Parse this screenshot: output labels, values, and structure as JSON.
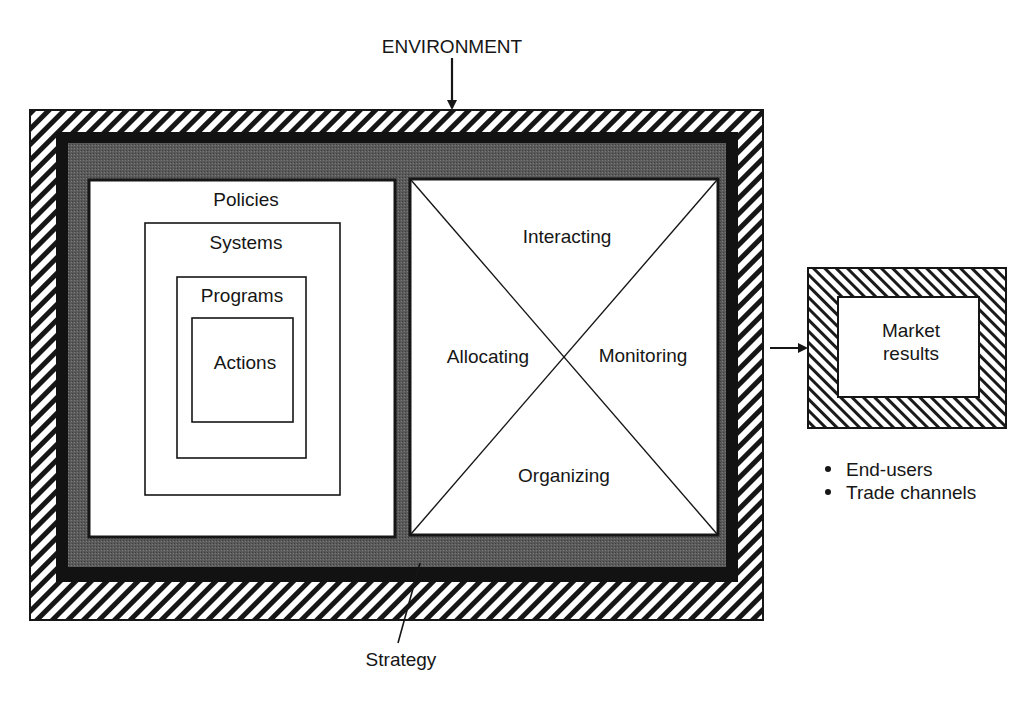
{
  "diagram": {
    "environment_label": "ENVIRONMENT",
    "strategy_label": "Strategy",
    "left_panel": {
      "nested_levels": [
        "Policies",
        "Systems",
        "Programs",
        "Actions"
      ]
    },
    "right_panel": {
      "quadrants": {
        "top": "Interacting",
        "left": "Allocating",
        "right": "Monitoring",
        "bottom": "Organizing"
      }
    },
    "output_box": {
      "label_line1": "Market",
      "label_line2": "results"
    },
    "output_bullets": [
      "End-users",
      "Trade channels"
    ]
  }
}
